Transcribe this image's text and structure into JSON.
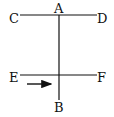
{
  "diagram": {
    "labels": {
      "A": "A",
      "B": "B",
      "C": "C",
      "D": "D",
      "E": "E",
      "F": "F"
    },
    "colors": {
      "line": "#111111",
      "background": "#ffffff"
    }
  }
}
